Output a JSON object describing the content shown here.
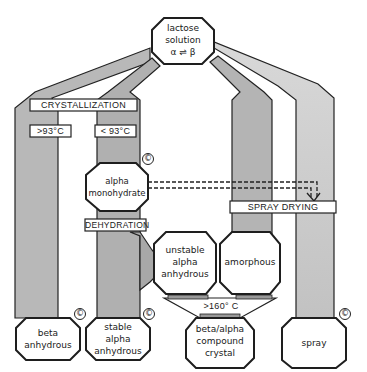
{
  "diagram": {
    "source": {
      "line1": "lactose",
      "line2": "solution",
      "line3": "α ⇌ β"
    },
    "processes": {
      "crystallization": "CRYSTALLIZATION",
      "above93": ">93°C",
      "below93": "< 93°C",
      "dehydration": "DEHYDRATION",
      "spray_drying": "SPRAY DRYING",
      "above160": ">160° C"
    },
    "nodes": {
      "alpha_monohydrate": {
        "line1": "alpha",
        "line2": "monohydrate",
        "commercial": true
      },
      "unstable_alpha": {
        "line1": "unstable",
        "line2": "alpha",
        "line3": "anhydrous",
        "commercial": false
      },
      "amorphous": {
        "line1": "amorphous",
        "commercial": false
      },
      "beta_anhydrous": {
        "line1": "beta",
        "line2": "anhydrous",
        "commercial": true
      },
      "stable_alpha": {
        "line1": "stable",
        "line2": "alpha",
        "line3": "anhydrous",
        "commercial": true
      },
      "beta_alpha_compound": {
        "line1": "beta/alpha",
        "line2": "compound",
        "line3": "crystal",
        "commercial": false
      },
      "spray": {
        "line1": "spray",
        "commercial": true
      }
    },
    "commercial_mark": "©",
    "colors": {
      "band_dark": "#a9a9a9",
      "band_light": "#cfcfcf",
      "stroke": "#1e1e1e"
    }
  }
}
